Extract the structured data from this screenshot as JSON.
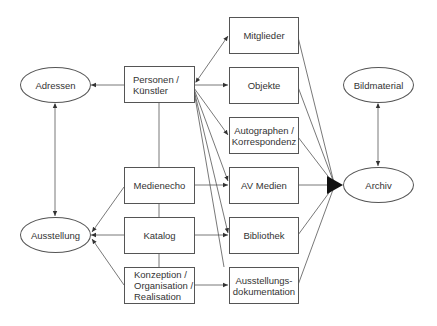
{
  "diagram": {
    "nodes": {
      "adressen": {
        "label": "Adressen",
        "shape": "ellipse"
      },
      "ausstellung": {
        "label": "Ausstellung",
        "shape": "ellipse"
      },
      "bildmaterial": {
        "label": "Bildmaterial",
        "shape": "ellipse"
      },
      "archiv": {
        "label": "Archiv",
        "shape": "ellipse"
      },
      "personen": {
        "label": "Personen /\nKünstler",
        "shape": "box"
      },
      "medienecho": {
        "label": "Medienecho",
        "shape": "box"
      },
      "katalog": {
        "label": "Katalog",
        "shape": "box"
      },
      "konzeption": {
        "label": "Konzeption /\nOrganisation /\nRealisation",
        "shape": "box"
      },
      "mitglieder": {
        "label": "Mitglieder",
        "shape": "box"
      },
      "objekte": {
        "label": "Objekte",
        "shape": "box"
      },
      "autographen": {
        "label": "Autographen /\nKorrespondenz",
        "shape": "box"
      },
      "avmedien": {
        "label": "AV Medien",
        "shape": "box"
      },
      "bibliothek": {
        "label": "Bibliothek",
        "shape": "box"
      },
      "ausstellungsdoku": {
        "label": "Ausstellungs-\ndokumentation",
        "shape": "box"
      }
    },
    "edges": [
      {
        "from": "personen",
        "to": "adressen",
        "type": "arrow"
      },
      {
        "from": "adressen",
        "to": "ausstellung",
        "type": "double-arrow"
      },
      {
        "from": "medienecho",
        "to": "ausstellung",
        "type": "arrow"
      },
      {
        "from": "katalog",
        "to": "ausstellung",
        "type": "arrow"
      },
      {
        "from": "konzeption",
        "to": "ausstellung",
        "type": "arrow"
      },
      {
        "from": "personen",
        "to": "medienecho",
        "type": "line"
      },
      {
        "from": "medienecho",
        "to": "katalog",
        "type": "line"
      },
      {
        "from": "katalog",
        "to": "konzeption",
        "type": "line"
      },
      {
        "from": "personen",
        "to": "mitglieder",
        "type": "double-arrow"
      },
      {
        "from": "personen",
        "to": "objekte",
        "type": "arrow"
      },
      {
        "from": "personen",
        "to": "autographen",
        "type": "arrow"
      },
      {
        "from": "personen",
        "to": "avmedien",
        "type": "arrow"
      },
      {
        "from": "personen",
        "to": "bibliothek",
        "type": "arrow"
      },
      {
        "from": "personen",
        "to": "ausstellungsdoku",
        "type": "line"
      },
      {
        "from": "medienecho",
        "to": "avmedien",
        "type": "arrow"
      },
      {
        "from": "katalog",
        "to": "bibliothek",
        "type": "arrow"
      },
      {
        "from": "konzeption",
        "to": "ausstellungsdoku",
        "type": "arrow"
      },
      {
        "from": "mitglieder",
        "to": "archiv",
        "type": "arrow"
      },
      {
        "from": "objekte",
        "to": "archiv",
        "type": "arrow"
      },
      {
        "from": "autographen",
        "to": "archiv",
        "type": "arrow"
      },
      {
        "from": "avmedien",
        "to": "archiv",
        "type": "arrow"
      },
      {
        "from": "bibliothek",
        "to": "archiv",
        "type": "arrow"
      },
      {
        "from": "ausstellungsdoku",
        "to": "archiv",
        "type": "arrow"
      },
      {
        "from": "bildmaterial",
        "to": "archiv",
        "type": "double-arrow"
      }
    ],
    "colors": {
      "stroke": "#555555",
      "text": "#333333",
      "background": "#ffffff"
    }
  }
}
